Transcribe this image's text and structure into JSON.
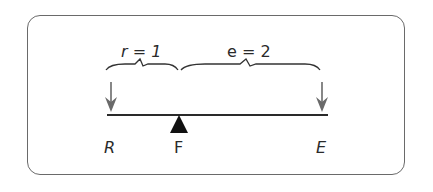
{
  "diagram": {
    "type": "lever",
    "labels": {
      "r": "r = 1",
      "e": "e = 2",
      "R": "R",
      "F": "F",
      "E": "E"
    },
    "colors": {
      "frame": "#6a6a6a",
      "beam": "#2a2a2a",
      "arrow": "#6a6a6a",
      "fulcrum": "#111111"
    }
  }
}
